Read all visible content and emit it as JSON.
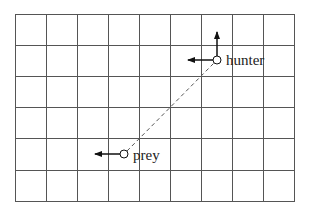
{
  "diagram": {
    "type": "grid-pursuit",
    "grid": {
      "columns": 9,
      "rows": 6,
      "line_color": "#555555"
    },
    "agents": [
      {
        "id": "hunter",
        "label": "hunter",
        "cell": [
          6,
          1
        ],
        "arrows": [
          "up",
          "left"
        ]
      },
      {
        "id": "prey",
        "label": "prey",
        "cell": [
          3,
          4
        ],
        "arrows": [
          "left"
        ]
      }
    ],
    "connector": {
      "style": "dashed",
      "from": "prey",
      "to": "hunter"
    }
  }
}
